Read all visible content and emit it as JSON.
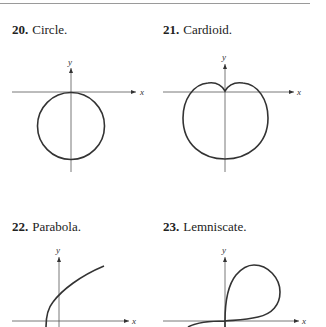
{
  "figures": [
    {
      "number": "20.",
      "title": "Circle.",
      "x_label": "x",
      "y_label": "y"
    },
    {
      "number": "21.",
      "title": "Cardioid.",
      "x_label": "x",
      "y_label": "y"
    },
    {
      "number": "22.",
      "title": "Parabola.",
      "x_label": "x",
      "y_label": "y"
    },
    {
      "number": "23.",
      "title": "Lemniscate.",
      "x_label": "x",
      "y_label": "y"
    }
  ],
  "colors": {
    "curve": "#333333",
    "axis": "#555555",
    "text": "#222222",
    "rule": "#9a9a9a"
  }
}
